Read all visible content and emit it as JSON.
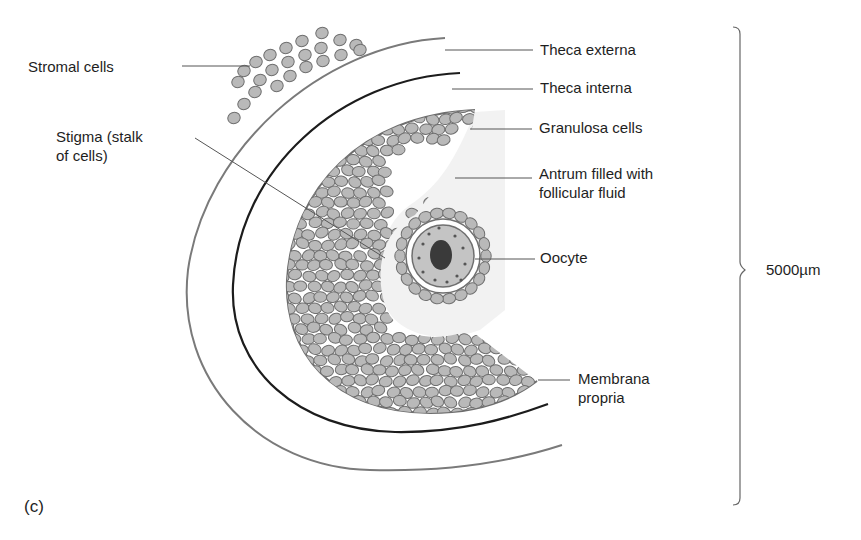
{
  "figure": {
    "panel_label": "(c)",
    "scale_label": "5000µm",
    "labels": {
      "stromal_cells": "Stromal cells",
      "stigma_line1": "Stigma (stalk",
      "stigma_line2": "of cells)",
      "theca_externa": "Theca externa",
      "theca_interna": "Theca interna",
      "granulosa_cells": "Granulosa cells",
      "antrum_line1": "Antrum filled with",
      "antrum_line2": "follicular fluid",
      "oocyte": "Oocyte",
      "membrana_line1": "Membrana",
      "membrana_line2": "propria"
    },
    "colors": {
      "cell_fill": "#b9b9b9",
      "cell_stroke": "#6f6f6f",
      "theca_externa_line": "#7a7a7a",
      "theca_interna_line": "#1c1c1c",
      "membrana_line": "#6e6e6e",
      "antrum_fill": "#f1f1f1",
      "nucleus": "#3a3a3a",
      "leader_line": "#555555"
    }
  }
}
